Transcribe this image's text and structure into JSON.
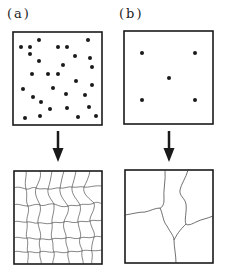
{
  "panels": [
    {
      "label": "(a)",
      "description": "many nucleation sites leading to fine grain structure",
      "dots": [
        [
          21,
          47
        ],
        [
          30,
          47
        ],
        [
          39,
          40
        ],
        [
          58,
          47
        ],
        [
          67,
          47
        ],
        [
          88,
          40
        ],
        [
          30,
          54
        ],
        [
          75,
          56
        ],
        [
          90,
          58
        ],
        [
          39,
          61
        ],
        [
          63,
          65
        ],
        [
          92,
          67
        ],
        [
          32,
          74
        ],
        [
          48,
          74
        ],
        [
          58,
          74
        ],
        [
          76,
          81
        ],
        [
          23,
          89
        ],
        [
          53,
          88
        ],
        [
          92,
          85
        ],
        [
          33,
          97
        ],
        [
          66,
          94
        ],
        [
          85,
          95
        ],
        [
          41,
          102
        ],
        [
          50,
          109
        ],
        [
          67,
          108
        ],
        [
          89,
          107
        ],
        [
          25,
          118
        ],
        [
          40,
          116
        ],
        [
          78,
          117
        ],
        [
          96,
          116
        ]
      ]
    },
    {
      "label": "(b)",
      "description": "few nucleation sites leading to coarse grain structure",
      "dots": [
        [
          142,
          53
        ],
        [
          195,
          53
        ],
        [
          169,
          78
        ],
        [
          142,
          100
        ],
        [
          195,
          100
        ]
      ]
    }
  ],
  "colors": {
    "ink": "#1a1a1a",
    "background": "#ffffff"
  }
}
